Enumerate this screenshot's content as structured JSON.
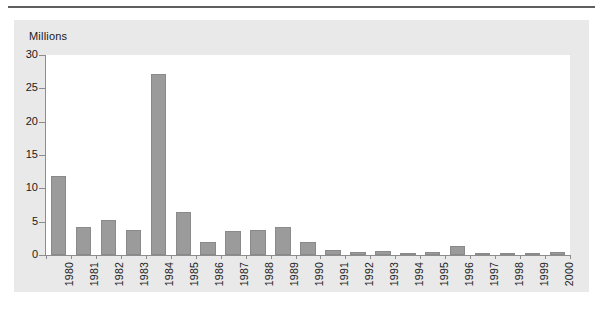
{
  "figure": {
    "background_color": "#ffffff",
    "panel_color": "#e9e9e9",
    "plot_color": "#ffffff",
    "bar_color": "#9b9b9b",
    "bar_border_color": "#8a8a8a",
    "axis_color": "#8d8d8d",
    "text_color": "#1a1a1a",
    "rule_color": "#5e5e5e"
  },
  "chart_data": {
    "type": "bar",
    "title": "",
    "subtitle": "",
    "xlabel": "",
    "ylabel": "Millions",
    "ylim": [
      0,
      30
    ],
    "yticks": [
      0,
      5,
      10,
      15,
      20,
      25,
      30
    ],
    "ytick_labels": [
      "0",
      "5",
      "10",
      "15",
      "20",
      "25",
      "30"
    ],
    "grid": false,
    "legend": null,
    "legend_position": "none",
    "categories": [
      "1980",
      "1981",
      "1982",
      "1983",
      "1984",
      "1985",
      "1986",
      "1987",
      "1988",
      "1989",
      "1990",
      "1991",
      "1992",
      "1993",
      "1994",
      "1995",
      "1996",
      "1997",
      "1998",
      "1999",
      "2000"
    ],
    "values": [
      11.8,
      4.2,
      5.3,
      3.7,
      27.1,
      6.4,
      1.9,
      3.6,
      3.8,
      4.2,
      1.9,
      0.7,
      0.5,
      0.6,
      0.25,
      0.4,
      1.4,
      0.25,
      0.25,
      0.2,
      0.45
    ]
  }
}
